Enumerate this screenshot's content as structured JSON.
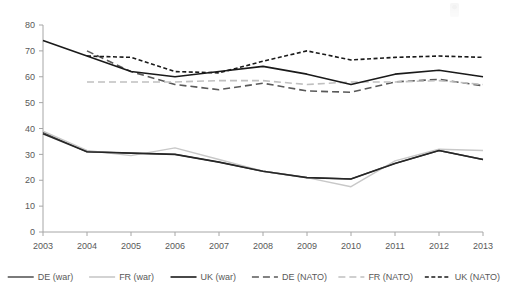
{
  "chart_data": {
    "type": "line",
    "title": "",
    "xlabel": "",
    "ylabel": "",
    "x": [
      "2003",
      "2004",
      "2005",
      "2006",
      "2007",
      "2008",
      "2009",
      "2010",
      "2011",
      "2012",
      "2013"
    ],
    "categories": [
      "2003",
      "2004",
      "2005",
      "2006",
      "2007",
      "2008",
      "2009",
      "2010",
      "2011",
      "2012",
      "2013"
    ],
    "ylim": [
      0,
      80
    ],
    "yticks": [
      0,
      10,
      20,
      30,
      40,
      50,
      60,
      70,
      80
    ],
    "ytick_labels": [
      "0",
      "10",
      "20",
      "30",
      "40",
      "50",
      "60",
      "70",
      "80"
    ],
    "grid": false,
    "legend_position": "bottom",
    "series": [
      {
        "name": "DE (war)",
        "key": "de_war",
        "style": "solid",
        "color": "#595959",
        "width": 1.4,
        "values": [
          38.5,
          31.0,
          30.5,
          30.0,
          27.0,
          23.5,
          21.0,
          20.5,
          26.5,
          31.5,
          28.0
        ]
      },
      {
        "name": "FR (war)",
        "key": "fr_war",
        "style": "solid",
        "color": "#c8c8c8",
        "width": 1.4,
        "values": [
          39.0,
          31.5,
          29.5,
          32.5,
          28.0,
          23.5,
          21.0,
          17.5,
          27.5,
          32.0,
          31.5
        ]
      },
      {
        "name": "UK (war)",
        "key": "uk_war",
        "style": "solid",
        "color": "#262626",
        "width": 1.6,
        "values": [
          38.0,
          31.0,
          30.5,
          30.0,
          27.0,
          23.5,
          21.0,
          20.5,
          26.5,
          31.5,
          28.0
        ]
      },
      {
        "name": "DE (NATO)",
        "key": "de_nato",
        "style": "longdash",
        "color": "#595959",
        "width": 1.6,
        "values": [
          null,
          70.0,
          62.0,
          57.0,
          55.0,
          57.5,
          54.5,
          54.0,
          58.0,
          59.0,
          56.5
        ]
      },
      {
        "name": "FR (NATO)",
        "key": "fr_nato",
        "style": "longdash",
        "color": "#c0c0c0",
        "width": 1.6,
        "values": [
          null,
          58.0,
          58.0,
          58.0,
          58.5,
          58.5,
          57.0,
          58.0,
          58.0,
          58.5,
          57.0
        ]
      },
      {
        "name": "UK (NATO)",
        "key": "uk_nato",
        "style": "dotdash",
        "color": "#1a1a1a",
        "width": 1.6,
        "values": [
          null,
          68.0,
          67.5,
          62.0,
          61.5,
          66.0,
          70.0,
          66.5,
          67.5,
          68.0,
          67.5
        ]
      },
      {
        "name": "UK (war) upper",
        "key": "uk_war_upper",
        "style": "solid",
        "color": "#1a1a1a",
        "width": 1.6,
        "values": [
          74.0,
          68.0,
          62.0,
          60.0,
          62.0,
          64.0,
          61.0,
          57.0,
          61.0,
          62.5,
          60.0
        ]
      }
    ],
    "legend": [
      {
        "label": "DE (war)",
        "style": "solid",
        "color": "#595959"
      },
      {
        "label": "FR (war)",
        "style": "solid",
        "color": "#c8c8c8"
      },
      {
        "label": "UK (war)",
        "style": "solid",
        "color": "#1a1a1a"
      },
      {
        "label": "DE (NATO)",
        "style": "longdash",
        "color": "#595959"
      },
      {
        "label": "FR (NATO)",
        "style": "longdash",
        "color": "#c0c0c0"
      },
      {
        "label": "UK (NATO)",
        "style": "dotdash",
        "color": "#1a1a1a"
      }
    ]
  }
}
